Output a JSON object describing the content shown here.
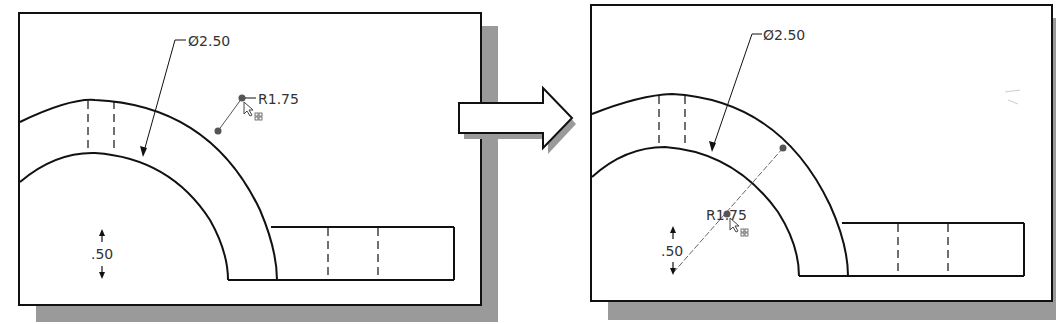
{
  "diagram": {
    "type": "before-after CAD sketch dimension edit",
    "colors": {
      "line": "#111111",
      "dim_text": "#333333",
      "shadow": "#9a9a9a"
    },
    "before": {
      "diameter_label": "Ø2.50",
      "radius_label": "R1.75",
      "thickness_label": ".50"
    },
    "arrow": {
      "direction": "right"
    },
    "after": {
      "diameter_label": "Ø2.50",
      "radius_label": "R1.75",
      "thickness_label": ".50"
    },
    "cursor_icon": "move-cursor-icon"
  }
}
